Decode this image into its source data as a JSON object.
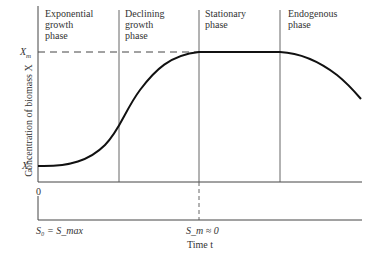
{
  "diagram": {
    "y_axis_label": "Concentration of biomass X",
    "x_axis_label": "Time t",
    "y_markers": {
      "top": "X_m",
      "bottom": "X_0"
    },
    "origin_label": "0",
    "phases": [
      {
        "name": "Exponential growth phase",
        "lines": [
          "Exponential",
          "growth",
          "phase"
        ]
      },
      {
        "name": "Declining growth phase",
        "lines": [
          "Declining",
          "growth",
          "phase"
        ]
      },
      {
        "name": "Stationary phase",
        "lines": [
          "Stationary",
          "phase"
        ]
      },
      {
        "name": "Endogenous phase",
        "lines": [
          "Endogenous",
          "phase"
        ]
      }
    ],
    "substrate_labels": {
      "start": "S₀ = S_max",
      "stationary": "S_m ≈ 0"
    }
  }
}
